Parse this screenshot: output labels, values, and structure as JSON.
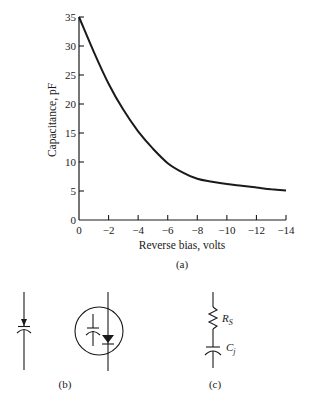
{
  "chart_data": {
    "type": "line",
    "title": "",
    "xlabel": "Reverse bias, volts",
    "ylabel": "Capacitance, pF",
    "xlim": [
      0,
      -14
    ],
    "ylim": [
      0,
      35
    ],
    "grid": false,
    "legend": null,
    "x_ticks": [
      "0",
      "−2",
      "−4",
      "−6",
      "−8",
      "−10",
      "−12",
      "−14"
    ],
    "y_ticks": [
      "0",
      "5",
      "10",
      "15",
      "20",
      "25",
      "30",
      "35"
    ],
    "series": [
      {
        "name": "Varactor junction capacitance",
        "x": [
          0,
          -1,
          -2,
          -3,
          -4,
          -5,
          -6,
          -7,
          -8,
          -9,
          -10,
          -11,
          -12,
          -13,
          -14
        ],
        "values": [
          35,
          29,
          23.5,
          19,
          15.3,
          12.3,
          9.8,
          8.2,
          7.1,
          6.6,
          6.2,
          5.9,
          5.6,
          5.3,
          5.1
        ]
      }
    ],
    "caption": "(a)"
  },
  "figure": {
    "panel_a_label": "(a)",
    "panel_b_label": "(b)",
    "panel_c_label": "(c)",
    "symbol_rs": "R",
    "symbol_rs_sub": "S",
    "symbol_cj": "C",
    "symbol_cj_sub": "j"
  }
}
